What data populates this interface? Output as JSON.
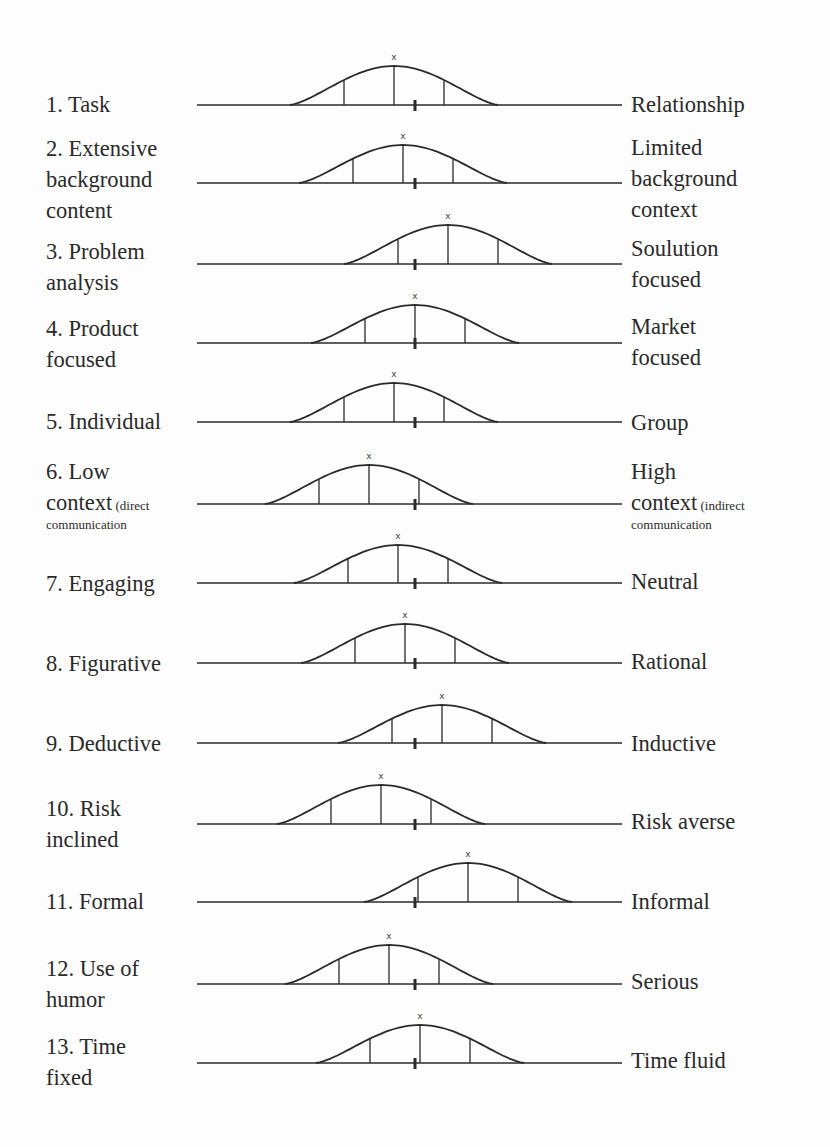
{
  "diagram": {
    "title": "",
    "marker_glyph": "x",
    "scale": {
      "line_start_x": 197,
      "line_end_x": 622,
      "center_x": 415,
      "curve_half_width": 104,
      "sub_line_offset": 50
    },
    "rows": [
      {
        "id": 1,
        "left": [
          "1. Task"
        ],
        "right": [
          "Relationship"
        ],
        "baseline_y": 105,
        "peak_x": 394,
        "peak_y": 66,
        "left_top": 89,
        "right_top": 89
      },
      {
        "id": 2,
        "left": [
          "2. Extensive",
          "background",
          "content"
        ],
        "right": [
          "Limited",
          "background",
          "context"
        ],
        "baseline_y": 183,
        "peak_x": 403,
        "peak_y": 145,
        "left_top": 133,
        "right_top": 132
      },
      {
        "id": 3,
        "left": [
          "3. Problem",
          "analysis"
        ],
        "right": [
          "Soulution",
          "focused"
        ],
        "baseline_y": 264,
        "peak_x": 448,
        "peak_y": 225,
        "left_top": 236,
        "right_top": 233
      },
      {
        "id": 4,
        "left": [
          "4. Product",
          "focused"
        ],
        "right": [
          "Market",
          "focused"
        ],
        "baseline_y": 343,
        "peak_x": 415,
        "peak_y": 305,
        "left_top": 313,
        "right_top": 311
      },
      {
        "id": 5,
        "left": [
          "5. Individual"
        ],
        "right": [
          "Group"
        ],
        "baseline_y": 422,
        "peak_x": 394,
        "peak_y": 383,
        "left_top": 406,
        "right_top": 407
      },
      {
        "id": 6,
        "left": [
          "6. Low",
          "context"
        ],
        "left_small": "(direct",
        "left_sub": "communication",
        "right": [
          "High",
          "context"
        ],
        "right_small": "(indirect",
        "right_sub": "communication",
        "baseline_y": 504,
        "peak_x": 369,
        "peak_y": 465,
        "left_top": 456,
        "right_top": 456
      },
      {
        "id": 7,
        "left": [
          "7. Engaging"
        ],
        "right": [
          "Neutral"
        ],
        "baseline_y": 583,
        "peak_x": 398,
        "peak_y": 545,
        "left_top": 568,
        "right_top": 566
      },
      {
        "id": 8,
        "left": [
          "8. Figurative"
        ],
        "right": [
          "Rational"
        ],
        "baseline_y": 663,
        "peak_x": 405,
        "peak_y": 624,
        "left_top": 648,
        "right_top": 646
      },
      {
        "id": 9,
        "left": [
          "9. Deductive"
        ],
        "right": [
          "Inductive"
        ],
        "baseline_y": 743,
        "peak_x": 442,
        "peak_y": 705,
        "left_top": 728,
        "right_top": 728
      },
      {
        "id": 10,
        "left": [
          "10. Risk",
          "inclined"
        ],
        "right": [
          "Risk averse"
        ],
        "baseline_y": 824,
        "peak_x": 381,
        "peak_y": 785,
        "left_top": 793,
        "right_top": 806
      },
      {
        "id": 11,
        "left": [
          "11. Formal"
        ],
        "right": [
          "Informal"
        ],
        "baseline_y": 902,
        "peak_x": 468,
        "peak_y": 863,
        "left_top": 886,
        "right_top": 886
      },
      {
        "id": 12,
        "left": [
          "12. Use of",
          "humor"
        ],
        "right": [
          "Serious"
        ],
        "baseline_y": 984,
        "peak_x": 389,
        "peak_y": 945,
        "left_top": 953,
        "right_top": 966
      },
      {
        "id": 13,
        "left": [
          "13. Time",
          "fixed"
        ],
        "right": [
          "Time fluid"
        ],
        "baseline_y": 1063,
        "peak_x": 420,
        "peak_y": 1025,
        "left_top": 1031,
        "right_top": 1045
      }
    ]
  },
  "colors": {
    "ink": "#2a2a2a",
    "background": "#fdfdfd"
  }
}
